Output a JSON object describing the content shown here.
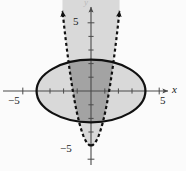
{
  "figure": {
    "title": "",
    "background_color": "#fbfbfb",
    "axis_color": "#4a4a4a",
    "curve_color": "#111111",
    "shade_light": "#d9d9d9",
    "shade_dark": "#a3a3a3"
  },
  "axes": {
    "x_label": "x",
    "y_label": "y",
    "x_tick_labels": [
      "-5",
      "5"
    ],
    "y_tick_labels": [
      "5",
      "-5"
    ],
    "x_neg5_label": "−5",
    "x_pos5_label": "5",
    "y_pos5_label": "5",
    "y_neg5_label": "−5"
  },
  "chart_data": {
    "type": "line",
    "title": "",
    "xlabel": "x",
    "ylabel": "y",
    "xlim": [
      -6.7,
      7.0
    ],
    "ylim": [
      -5.9,
      5.9
    ],
    "grid": false,
    "legend": "none",
    "x_ticks": [
      -5,
      -4,
      -3,
      -2,
      -1,
      1,
      2,
      3,
      4,
      5
    ],
    "y_ticks": [
      -5,
      -4,
      -3,
      -2,
      -1,
      1,
      2,
      3,
      4,
      5
    ],
    "x_tick_labeled": [
      -5,
      5
    ],
    "y_tick_labeled": [
      -5,
      5
    ],
    "series": [
      {
        "name": "ellipse",
        "kind": "ellipse",
        "style": "solid",
        "linewidth": 2.2,
        "center": [
          0,
          0
        ],
        "semi_axis_x": 4.0,
        "semi_axis_y": 2.3,
        "equation": "x^2/16 + y^2/5.3 = 1",
        "fill": "interior",
        "arrows": "none"
      },
      {
        "name": "parabola",
        "kind": "parabola",
        "style": "dashed",
        "linewidth": 2.2,
        "vertex": [
          0,
          -4
        ],
        "coefficient_a": 2.25,
        "equation": "y = 2.25x^2 - 4",
        "opens": "up",
        "fill": "interior",
        "arrows": "both-ends-up",
        "x_at_y5": [
          -2.0,
          2.0
        ]
      }
    ],
    "regions": [
      {
        "name": "parabola-interior",
        "shade": "light",
        "color": "#d9d9d9",
        "description": "region on or above the parabola y >= 2.25x^2 - 4"
      },
      {
        "name": "ellipse-interior",
        "shade": "light",
        "color": "#d9d9d9",
        "description": "region inside the ellipse"
      },
      {
        "name": "overlap",
        "shade": "dark",
        "color": "#a3a3a3",
        "description": "intersection of ellipse interior and parabola interior"
      }
    ]
  }
}
